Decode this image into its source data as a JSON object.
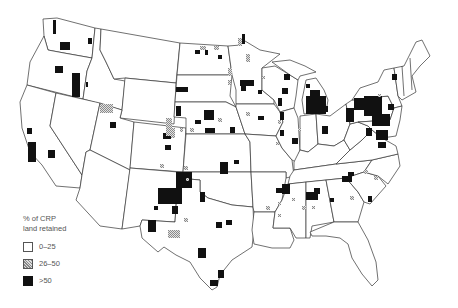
{
  "map": {
    "title": "",
    "subject": "Percent of CRP land retained by region, contiguous United States",
    "colors": {
      "background": "#ffffff",
      "border": "#333333",
      "high": "#111111",
      "medium_hatch": "#999999",
      "low": "#ffffff"
    }
  },
  "legend": {
    "title_line1": "% of CRP",
    "title_line2": "land retained",
    "items": [
      {
        "label": "0–25",
        "style": "white"
      },
      {
        "label": "26–50",
        "style": "hatched"
      },
      {
        "label": ">50",
        "style": "black"
      }
    ]
  }
}
